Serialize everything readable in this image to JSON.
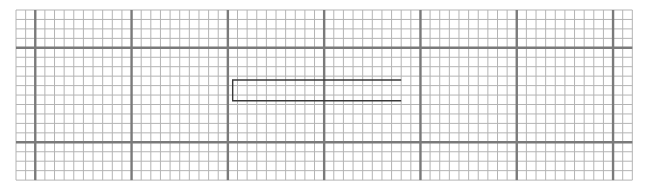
{
  "figure": {
    "type": "graph-paper-drawing",
    "grid": {
      "minor_columns": 64,
      "minor_rows": 18,
      "minor_per_major": 10,
      "major_column_offsets": [
        2,
        12,
        22,
        32,
        42,
        52,
        62
      ],
      "major_row_offsets": [
        4,
        14
      ],
      "colors": {
        "minor": "#b4b4b4",
        "major": "#7a7a7a",
        "background": "#ffffff"
      }
    },
    "shape": {
      "kind": "open-rectangle",
      "open_side": "right",
      "start_col": 22.5,
      "end_col": 40,
      "top_row": 7.4,
      "bottom_row": 9.6,
      "color": "#3a3a3a"
    }
  }
}
